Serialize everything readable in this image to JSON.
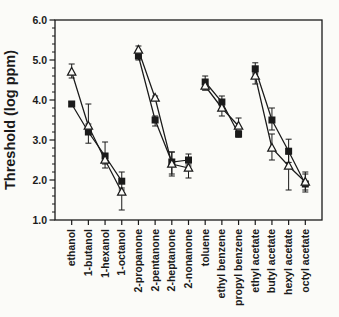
{
  "figure": {
    "background": "#fbfbf8",
    "foreground": "#1a1a1a"
  },
  "chart_data": {
    "type": "line",
    "title": "",
    "xlabel": "",
    "ylabel": "Threshold (log ppm)",
    "ylim": [
      1.0,
      6.0
    ],
    "y_major_ticks": [
      "1.0",
      "2.0",
      "3.0",
      "4.0",
      "5.0",
      "6.0"
    ],
    "y_minor_step": 0.2,
    "grid": false,
    "legend": "none",
    "categories": [
      "ethanol",
      "1-butanol",
      "1-hexanol",
      "1-octanol",
      "2-propanone",
      "2-pentanone",
      "2-heptanone",
      "2-nonanone",
      "toluene",
      "ethyl benzene",
      "propyl benzene",
      "ethyl acetate",
      "butyl acetate",
      "hexyl acetate",
      "octyl acetate"
    ],
    "category_groups": [
      [
        0,
        3
      ],
      [
        4,
        7
      ],
      [
        8,
        10
      ],
      [
        11,
        14
      ]
    ],
    "series": [
      {
        "name": "filled-square",
        "marker": "square",
        "marker_fill": "filled",
        "values": [
          3.9,
          3.2,
          2.6,
          1.97,
          5.1,
          3.5,
          2.45,
          2.5,
          4.45,
          3.95,
          3.15,
          4.78,
          3.5,
          2.72,
          1.9
        ],
        "errors": [
          [
            0.05,
            0.05
          ],
          [
            0.28,
            0.2
          ],
          [
            0.3,
            0.35
          ],
          [
            0.22,
            0.23
          ],
          [
            0.1,
            0.05
          ],
          [
            0.15,
            0.1
          ],
          [
            0.3,
            0.25
          ],
          [
            0.15,
            0.15
          ],
          [
            0.2,
            0.15
          ],
          [
            0.2,
            0.15
          ],
          [
            0.08,
            0.08
          ],
          [
            0.1,
            0.15
          ],
          [
            0.25,
            0.3
          ],
          [
            0.28,
            0.3
          ],
          [
            0.15,
            0.25
          ]
        ]
      },
      {
        "name": "open-triangle",
        "marker": "triangle-up",
        "marker_fill": "open",
        "values": [
          4.7,
          3.35,
          2.5,
          1.7,
          5.25,
          4.05,
          2.4,
          2.3,
          4.35,
          3.8,
          3.35,
          4.6,
          2.8,
          2.35,
          1.95
        ],
        "errors": [
          [
            0.15,
            0.2
          ],
          [
            0.1,
            0.55
          ],
          [
            0.1,
            0.1
          ],
          [
            0.45,
            0.1
          ],
          [
            0.05,
            0.1
          ],
          [
            0.05,
            0.05
          ],
          [
            0.3,
            0.3
          ],
          [
            0.25,
            0.1
          ],
          [
            0.1,
            0.05
          ],
          [
            0.2,
            0.05
          ],
          [
            0.05,
            0.2
          ],
          [
            0.2,
            0.05
          ],
          [
            0.3,
            0.35
          ],
          [
            0.6,
            0.3
          ],
          [
            0.25,
            0.25
          ]
        ]
      }
    ]
  }
}
